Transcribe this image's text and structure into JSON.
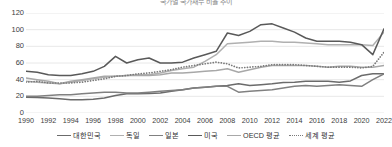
{
  "chart_data": {
    "type": "line",
    "title": "국가별 국가채무 비율 추이",
    "xlabel": "",
    "ylabel": "",
    "ylim": [
      0,
      120
    ],
    "yticks": [
      0,
      20,
      40,
      60,
      80,
      100,
      120
    ],
    "grid": true,
    "legend_position": "bottom",
    "x": [
      1990,
      1991,
      1992,
      1993,
      1994,
      1995,
      1996,
      1997,
      1998,
      1999,
      2000,
      2001,
      2002,
      2003,
      2004,
      2005,
      2006,
      2007,
      2008,
      2009,
      2010,
      2011,
      2012,
      2013,
      2014,
      2015,
      2016,
      2017,
      2018,
      2019,
      2020,
      2021,
      2022
    ],
    "xticks": [
      1990,
      1992,
      1994,
      1996,
      1998,
      2000,
      2002,
      2004,
      2006,
      2008,
      2010,
      2012,
      2014,
      2016,
      2018,
      2020,
      2022
    ],
    "series": [
      {
        "name": "대한민국",
        "color": "#6b6b6b",
        "style": "solid",
        "values": [
          19,
          18.5,
          18,
          17,
          16,
          16,
          16.5,
          18,
          21,
          23,
          23,
          23.5,
          24,
          26,
          28,
          30,
          31,
          32,
          33,
          35,
          33,
          34,
          35,
          36.5,
          37,
          38,
          38,
          38,
          37,
          38.5,
          45,
          47,
          47
        ]
      },
      {
        "name": "독일",
        "color": "#b0b0b0",
        "style": "solid",
        "values": [
          38,
          37,
          36,
          35,
          37,
          39,
          41,
          43,
          44,
          45,
          46,
          46,
          48,
          51,
          53,
          55,
          62,
          70,
          83,
          84,
          85,
          86,
          86,
          85,
          85,
          84,
          83,
          82,
          82,
          82,
          82,
          81,
          97
        ]
      },
      {
        "name": "일본",
        "color": "#808080",
        "style": "solid",
        "values": [
          20,
          20,
          21,
          22,
          22,
          23,
          24,
          25,
          25,
          24,
          24,
          25,
          26,
          27,
          28,
          30,
          31,
          32,
          32,
          25,
          26,
          27,
          28,
          30,
          32,
          33,
          32,
          33,
          34,
          33,
          32,
          40,
          47
        ]
      },
      {
        "name": "미국",
        "color": "#595959",
        "style": "solid",
        "values": [
          50,
          49,
          46,
          45,
          45,
          47,
          50,
          56,
          68,
          60,
          64,
          66,
          60,
          60,
          61,
          66,
          70,
          74,
          96,
          93,
          98,
          106,
          107,
          102,
          97,
          90,
          86,
          86,
          86,
          85,
          82,
          70,
          101
        ]
      },
      {
        "name": "OECD 평균",
        "color": "#a8a8a8",
        "style": "solid",
        "values": [
          42,
          40,
          38,
          35,
          38,
          40,
          42,
          44,
          44,
          45,
          45,
          45,
          46,
          48,
          48,
          49,
          50,
          51,
          53,
          49,
          52,
          55,
          57,
          57,
          57,
          57,
          56,
          55,
          56,
          56,
          55,
          55,
          57
        ]
      },
      {
        "name": "세계 평균",
        "color": "#7a7a7a",
        "style": "dotted",
        "values": [
          37,
          38,
          36,
          36,
          36,
          37,
          39,
          41,
          44,
          45,
          47,
          48,
          50,
          52,
          55,
          57,
          59,
          61,
          59,
          54,
          55,
          56,
          58,
          58,
          58,
          57,
          56,
          55,
          55,
          55,
          54,
          56,
          73
        ]
      }
    ]
  },
  "axis": {
    "y_labels": [
      "120",
      "100",
      "80",
      "60",
      "40",
      "20",
      "0"
    ],
    "x_labels": [
      "1990",
      "1992",
      "1994",
      "1996",
      "1998",
      "2000",
      "2002",
      "2004",
      "2006",
      "2008",
      "2010",
      "2012",
      "2014",
      "2016",
      "2018",
      "2020",
      "2022"
    ]
  },
  "legend": {
    "items": [
      {
        "label": "대한민국",
        "color": "#6b6b6b",
        "style": "solid"
      },
      {
        "label": "독일",
        "color": "#b0b0b0",
        "style": "solid"
      },
      {
        "label": "일본",
        "color": "#808080",
        "style": "solid"
      },
      {
        "label": "미국",
        "color": "#595959",
        "style": "solid"
      },
      {
        "label": "OECD 평균",
        "color": "#a8a8a8",
        "style": "solid"
      },
      {
        "label": "세계 평균",
        "color": "#7a7a7a",
        "style": "dotted"
      }
    ]
  }
}
